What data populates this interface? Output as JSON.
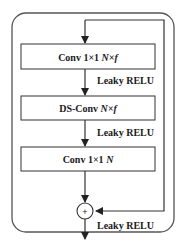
{
  "diagram": {
    "title": "",
    "blocks": [
      {
        "id": "conv1",
        "text_main": "Conv 1×1 ",
        "text_italic": "N×f"
      },
      {
        "id": "dsconv",
        "text_main": "DS-Conv ",
        "text_italic": "N×f"
      },
      {
        "id": "conv2",
        "text_main": "Conv 1×1 ",
        "text_italic": "N"
      }
    ],
    "activations": [
      "Leaky RELU",
      "Leaky RELU",
      "Leaky RELU"
    ],
    "sum_symbol": "+",
    "colors": {
      "stroke": "#333333",
      "background": "#ffffff",
      "text": "#1a1a1a"
    }
  }
}
